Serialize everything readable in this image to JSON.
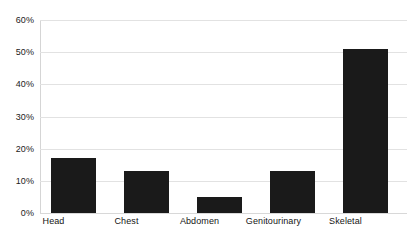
{
  "chart_data": {
    "type": "bar",
    "title": "",
    "subtitle": "",
    "xlabel": "",
    "ylabel": "",
    "categories": [
      "Head",
      "Chest",
      "Abdomen",
      "Genitourinary",
      "Skeletal"
    ],
    "values": [
      17,
      13,
      5,
      13,
      51
    ],
    "value_labels": [
      "17%",
      "13%",
      "5%",
      "13%",
      "51%"
    ],
    "ylim": [
      0,
      60
    ],
    "y_ticks": [
      0,
      10,
      20,
      30,
      40,
      50,
      60
    ],
    "y_tick_labels": [
      "0%",
      "10%",
      "20%",
      "30%",
      "40%",
      "50%",
      "60%"
    ],
    "grid": true,
    "grid_axis": "y",
    "legend": false,
    "legend_position": "none",
    "series": [
      {
        "name": "",
        "values": [
          17,
          13,
          5,
          13,
          51
        ]
      }
    ],
    "colors": {
      "bar": "#1a1a1a",
      "gridline": "#e2e2e2",
      "axis": "#d5d5d5",
      "background": "#ffffff",
      "text": "#1b1b1b"
    }
  }
}
